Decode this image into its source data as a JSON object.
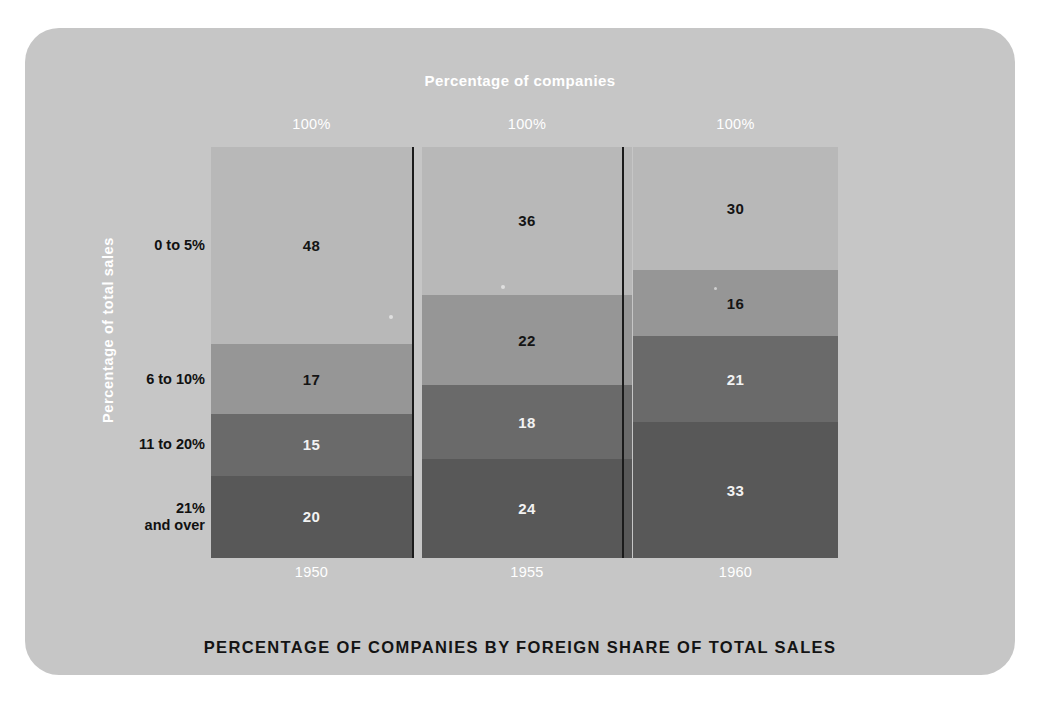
{
  "figure": {
    "top_title": "Percentage of companies",
    "bottom_title": "PERCENTAGE OF COMPANIES BY FOREIGN SHARE OF TOTAL SALES",
    "y_axis_title": "Percentage of  total sales",
    "card_color": "#c6c6c6",
    "background_color": "#ffffff"
  },
  "chart_data": {
    "type": "bar",
    "title": "PERCENTAGE OF COMPANIES BY FOREIGN SHARE OF TOTAL SALES",
    "subtitle": "Percentage of companies",
    "xlabel": "",
    "ylabel": "Percentage of  total sales",
    "ylim": [
      0,
      100
    ],
    "grid": false,
    "legend": "none",
    "stacked": true,
    "stack_order": "top-to-bottom",
    "categories": [
      "1950",
      "1955",
      "1960"
    ],
    "column_totals": [
      "100%",
      "100%",
      "100%"
    ],
    "series": [
      {
        "name": "0 to 5%",
        "values": [
          48,
          17,
          15
        ],
        "color": "#b8b8b8",
        "label_color": "#141414"
      },
      {
        "name": "6 to 10%",
        "values": [
          36,
          22,
          18
        ],
        "color": "#969696",
        "label_color": "#141414"
      },
      {
        "name": "11 to 20%",
        "values": [
          30,
          16,
          21
        ],
        "color": "#6a6a6a",
        "label_color": "#f2f2f2"
      },
      {
        "name": "21% and over",
        "values": [
          20,
          24,
          33
        ],
        "color": "#585858",
        "label_color": "#f2f2f2"
      }
    ],
    "columns": [
      {
        "year": "1950",
        "total_label": "100%",
        "segments": [
          {
            "band": "0 to 5%",
            "value": 48,
            "value_label": "48",
            "color": "#b8b8b8",
            "text_color": "#141414"
          },
          {
            "band": "6 to 10%",
            "value": 17,
            "value_label": "17",
            "color": "#969696",
            "text_color": "#141414"
          },
          {
            "band": "11 to 20%",
            "value": 15,
            "value_label": "15",
            "color": "#6a6a6a",
            "text_color": "#f2f2f2"
          },
          {
            "band": "21% and over",
            "value": 20,
            "value_label": "20",
            "color": "#585858",
            "text_color": "#f2f2f2"
          }
        ]
      },
      {
        "year": "1955",
        "total_label": "100%",
        "segments": [
          {
            "band": "0 to 5%",
            "value": 36,
            "value_label": "36",
            "color": "#b8b8b8",
            "text_color": "#141414"
          },
          {
            "band": "6 to 10%",
            "value": 22,
            "value_label": "22",
            "color": "#969696",
            "text_color": "#141414"
          },
          {
            "band": "11 to 20%",
            "value": 18,
            "value_label": "18",
            "color": "#6a6a6a",
            "text_color": "#f2f2f2"
          },
          {
            "band": "21% and over",
            "value": 24,
            "value_label": "24",
            "color": "#585858",
            "text_color": "#f2f2f2"
          }
        ]
      },
      {
        "year": "1960",
        "total_label": "100%",
        "segments": [
          {
            "band": "0 to 5%",
            "value": 30,
            "value_label": "30",
            "color": "#b8b8b8",
            "text_color": "#141414"
          },
          {
            "band": "6 to 10%",
            "value": 16,
            "value_label": "16",
            "color": "#969696",
            "text_color": "#141414"
          },
          {
            "band": "11 to 20%",
            "value": 21,
            "value_label": "21",
            "color": "#6a6a6a",
            "text_color": "#f2f2f2"
          },
          {
            "band": "21% and over",
            "value": 33,
            "value_label": "33",
            "color": "#585858",
            "text_color": "#f2f2f2"
          }
        ]
      }
    ],
    "row_labels": [
      {
        "text": "0 to 5%",
        "lines": [
          "0 to 5%"
        ]
      },
      {
        "text": "6 to 10%",
        "lines": [
          "6 to 10%"
        ]
      },
      {
        "text": "11 to 20%",
        "lines": [
          "11 to 20%"
        ]
      },
      {
        "text": "21% and over",
        "lines": [
          "21%",
          "and over"
        ]
      }
    ]
  },
  "layout": {
    "plot_left": 211,
    "plot_top": 147,
    "plot_width": 616,
    "plot_height": 411,
    "column_x": [
      0,
      211,
      422
    ],
    "column_width": [
      201,
      210,
      205
    ],
    "divider_x": [
      201,
      411
    ]
  }
}
